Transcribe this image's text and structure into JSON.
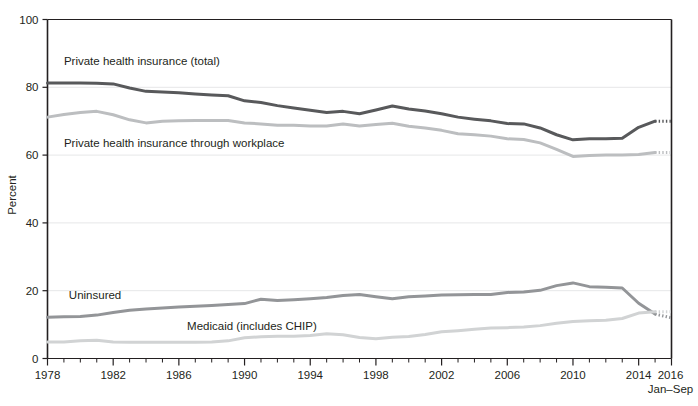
{
  "chart_data": {
    "type": "line",
    "title": "",
    "xlabel": "",
    "ylabel": "Percent",
    "ylim": [
      0,
      100
    ],
    "xlim": [
      1978,
      2016
    ],
    "yticks": [
      0,
      20,
      40,
      60,
      80,
      100
    ],
    "ytick_labels": [
      "0",
      "20",
      "40",
      "60",
      "80",
      "100"
    ],
    "xticks": [
      1978,
      1982,
      1986,
      1990,
      1994,
      1998,
      2002,
      2006,
      2010,
      2014,
      2016
    ],
    "xtick_labels": [
      "1978",
      "1982",
      "1986",
      "1990",
      "1994",
      "1998",
      "2002",
      "2006",
      "2010",
      "2014",
      "2016"
    ],
    "xtick_minor_step": 1,
    "grid": "horizontal",
    "legend_position": "inline-annotations",
    "x_axis_note": "Jan–Sep",
    "x": [
      1978,
      1979,
      1980,
      1981,
      1982,
      1983,
      1984,
      1985,
      1986,
      1987,
      1988,
      1989,
      1990,
      1991,
      1992,
      1993,
      1994,
      1995,
      1996,
      1997,
      1998,
      1999,
      2000,
      2001,
      2002,
      2003,
      2004,
      2005,
      2006,
      2007,
      2008,
      2009,
      2010,
      2011,
      2012,
      2013,
      2014,
      2015,
      2016
    ],
    "series": [
      {
        "name": "Private health insurance (total)",
        "color": "#58595b",
        "width": 3.0,
        "label_x": 1979.0,
        "label_y": 86.5,
        "values": [
          81.3,
          81.3,
          81.3,
          81.2,
          81.0,
          79.8,
          78.8,
          78.6,
          78.4,
          78.0,
          77.7,
          77.5,
          76.0,
          75.5,
          74.6,
          73.9,
          73.2,
          72.6,
          72.9,
          72.2,
          73.3,
          74.5,
          73.6,
          73.0,
          72.2,
          71.2,
          70.6,
          70.1,
          69.3,
          69.2,
          68.0,
          66.0,
          64.5,
          64.8,
          64.8,
          65.0,
          68.2,
          70.0,
          70.0
        ],
        "dashed_tail_from": 2015
      },
      {
        "name": "Private health insurance through workplace",
        "color": "#bcbec0",
        "width": 3.0,
        "label_x": 1979.0,
        "label_y": 62.4,
        "values": [
          71.2,
          72.0,
          72.6,
          72.9,
          71.9,
          70.4,
          69.5,
          70.0,
          70.1,
          70.2,
          70.2,
          70.2,
          69.5,
          69.2,
          68.8,
          68.8,
          68.6,
          68.6,
          69.2,
          68.6,
          69.0,
          69.4,
          68.5,
          68.0,
          67.3,
          66.3,
          66.0,
          65.6,
          64.8,
          64.6,
          63.6,
          61.7,
          59.6,
          59.9,
          60.0,
          60.0,
          60.2,
          60.8,
          60.8
        ],
        "dashed_tail_from": 2015
      },
      {
        "name": "Uninsured",
        "color": "#939598",
        "width": 3.0,
        "label_x": 1979.3,
        "label_y": 17.5,
        "values": [
          12.2,
          12.3,
          12.4,
          12.8,
          13.6,
          14.2,
          14.6,
          14.9,
          15.2,
          15.4,
          15.6,
          15.9,
          16.2,
          17.5,
          17.1,
          17.3,
          17.6,
          18.0,
          18.6,
          18.9,
          18.2,
          17.6,
          18.2,
          18.4,
          18.7,
          18.8,
          18.9,
          18.9,
          19.5,
          19.6,
          20.1,
          21.5,
          22.3,
          21.2,
          21.0,
          20.8,
          16.3,
          13.1,
          12.0
        ],
        "dashed_tail_from": 2015
      },
      {
        "name": "Medicaid (includes CHIP)",
        "color": "#d1d3d4",
        "width": 3.0,
        "label_x": 1986.5,
        "label_y": 8.3,
        "values": [
          4.9,
          4.9,
          5.2,
          5.4,
          4.9,
          4.8,
          4.8,
          4.8,
          4.8,
          4.8,
          4.9,
          5.2,
          6.1,
          6.4,
          6.6,
          6.6,
          6.8,
          7.3,
          7.0,
          6.2,
          5.8,
          6.3,
          6.5,
          7.1,
          7.9,
          8.2,
          8.6,
          9.0,
          9.1,
          9.3,
          9.7,
          10.4,
          10.9,
          11.1,
          11.3,
          11.8,
          13.4,
          13.8,
          13.8
        ],
        "dashed_tail_from": 2015
      }
    ]
  },
  "axis": {
    "y_title": "Percent",
    "x_note": "Jan–Sep"
  }
}
